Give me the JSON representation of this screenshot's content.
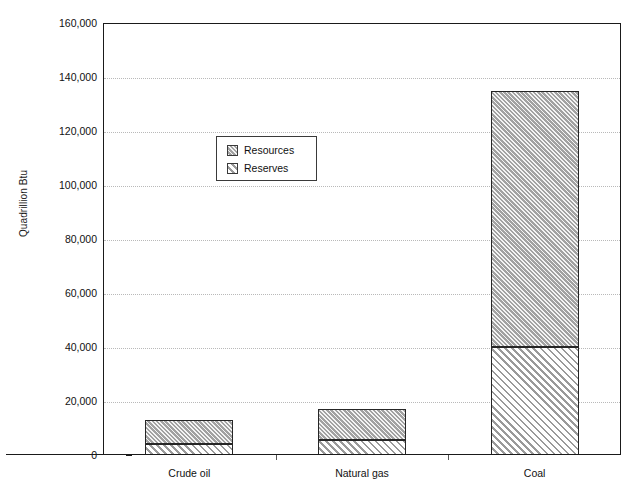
{
  "chart_data": {
    "type": "bar",
    "title": "",
    "subtitle": "",
    "xlabel": "",
    "ylabel": "Quadrillion Btu",
    "categories": [
      "Crude oil",
      "Natural gas",
      "Coal"
    ],
    "series": [
      {
        "name": "Reserves",
        "values": [
          4000,
          5400,
          40000
        ]
      },
      {
        "name": "Resources",
        "values": [
          9000,
          11600,
          95000
        ]
      }
    ],
    "totals": [
      13000,
      17000,
      135000
    ],
    "stacked": true,
    "ylim": [
      0,
      160000
    ],
    "ytick_step": 20000,
    "ytick_labels": [
      "160,000",
      "140,000",
      "120,000",
      "100,000",
      "80,000",
      "60,000",
      "40,000",
      "20,000",
      "0"
    ],
    "ytick_values": [
      160000,
      140000,
      120000,
      100000,
      80000,
      60000,
      40000,
      20000,
      0
    ],
    "grid": true,
    "grid_axis": "y",
    "legend": {
      "position": "inside-upper-left",
      "entries": [
        {
          "label": "Resources",
          "pattern": "dense-diagonal-hatch-gray",
          "color": "#b4b4b4"
        },
        {
          "label": "Reserves",
          "pattern": "sparse-diagonal-hatch-white",
          "color": "#ffffff"
        }
      ]
    },
    "colors": {
      "resources_fill": "#b4b4b4",
      "reserves_fill": "#ffffff",
      "hatch": "#9a9a9a",
      "axis": "#1a1a1a",
      "gridline": "#b9b9b9",
      "text": "#111111"
    }
  }
}
